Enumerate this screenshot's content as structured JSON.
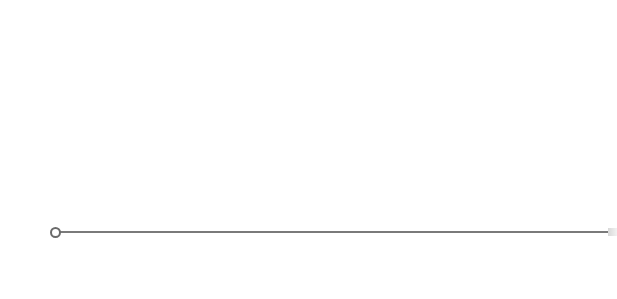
{
  "slider": {
    "value": 0,
    "track_color": "#7a7a7a",
    "thumb_border_color": "#6a6a6a"
  }
}
